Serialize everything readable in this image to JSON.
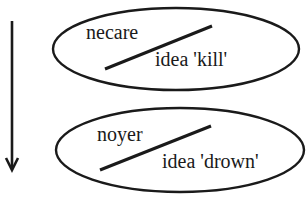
{
  "diagram": {
    "type": "semantic-change",
    "direction_arrow": "down-arrow",
    "stages": [
      {
        "word": "necare",
        "meaning": "idea 'kill'"
      },
      {
        "word": "noyer",
        "meaning": "idea 'drown'"
      }
    ],
    "colors": {
      "ink": "#1a1a1a",
      "background": "#ffffff"
    }
  }
}
